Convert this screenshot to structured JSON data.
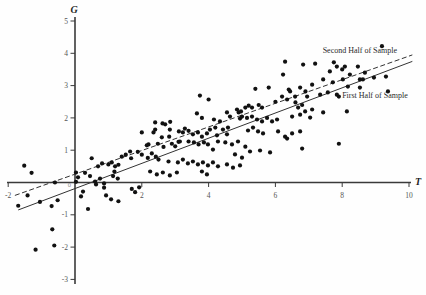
{
  "figure": {
    "background": "#fefefe"
  },
  "chart_data": {
    "type": "scatter",
    "title": "",
    "xlabel": "T",
    "ylabel": "G",
    "x_axis": {
      "min": -2,
      "max": 10,
      "ticks": [
        -2,
        2,
        4,
        6,
        8,
        10
      ]
    },
    "y_axis": {
      "min": -3,
      "max": 5,
      "ticks": [
        5,
        4,
        3,
        2,
        1,
        -1,
        -2,
        -3
      ]
    },
    "origin_label": "0",
    "grid": false,
    "legend_position": "inline-annotations",
    "colors": {
      "point": "#111111",
      "axis": "#3a3a3a",
      "tick_label": "#555555",
      "origin_label": "#8a8a8a",
      "line": "#333333",
      "annotation": "#2a2a2a"
    },
    "lines": [
      {
        "label": "Second Half of Sample",
        "style": "dashed",
        "x1": -1.8,
        "y1": -0.4,
        "x2": 10.1,
        "y2": 3.95
      },
      {
        "label": "First Half of Sample",
        "style": "solid",
        "x1": -1.7,
        "y1": -0.85,
        "x2": 10.1,
        "y2": 3.75
      }
    ],
    "annotations": [
      {
        "text": "Second Half of Sample",
        "x": 8.53,
        "y": 4.1
      },
      {
        "text": "First Half of Sample",
        "x": 8.98,
        "y": 2.71
      }
    ],
    "series": [
      {
        "name": "observations",
        "points": [
          [
            -1.52,
            0.52
          ],
          [
            -1.3,
            0.3
          ],
          [
            -1.7,
            -0.72
          ],
          [
            -1.42,
            -0.4
          ],
          [
            -1.05,
            -0.6
          ],
          [
            -0.7,
            -0.73
          ],
          [
            -0.52,
            -0.55
          ],
          [
            -0.6,
            0.0
          ],
          [
            -0.68,
            -1.45
          ],
          [
            -1.18,
            -2.08
          ],
          [
            -0.62,
            -1.95
          ],
          [
            0.03,
            0.31
          ],
          [
            0.09,
            0.16
          ],
          [
            0.03,
            0.02
          ],
          [
            0.24,
            -0.28
          ],
          [
            0.18,
            -0.43
          ],
          [
            0.39,
            -0.82
          ],
          [
            0.69,
            0.5
          ],
          [
            0.81,
            0.59
          ],
          [
            0.63,
            -0.06
          ],
          [
            0.87,
            -0.16
          ],
          [
            0.93,
            -0.4
          ],
          [
            1.08,
            -0.52
          ],
          [
            0.3,
            0.3
          ],
          [
            0.45,
            0.2
          ],
          [
            0.6,
            0.03
          ],
          [
            0.75,
            0.12
          ],
          [
            0.87,
            -0.03
          ],
          [
            0.5,
            0.75
          ],
          [
            1.0,
            0.56
          ],
          [
            1.1,
            0.62
          ],
          [
            1.2,
            0.5
          ],
          [
            1.3,
            0.55
          ],
          [
            1.14,
            0.2
          ],
          [
            1.28,
            0.12
          ],
          [
            1.18,
            0.34
          ],
          [
            1.4,
            0.8
          ],
          [
            1.52,
            0.86
          ],
          [
            1.68,
            0.75
          ],
          [
            1.88,
            0.95
          ],
          [
            1.65,
            0.96
          ],
          [
            1.3,
            -0.58
          ],
          [
            1.7,
            -0.2
          ],
          [
            1.8,
            -0.3
          ],
          [
            1.92,
            -0.15
          ],
          [
            2.0,
            1.55
          ],
          [
            2.35,
            1.55
          ],
          [
            2.6,
            1.4
          ],
          [
            2.82,
            1.42
          ],
          [
            2.2,
            1.18
          ],
          [
            2.48,
            1.2
          ],
          [
            2.65,
            1.1
          ],
          [
            2.9,
            1.2
          ],
          [
            3.0,
            1.12
          ],
          [
            2.0,
            0.86
          ],
          [
            2.18,
            0.76
          ],
          [
            2.3,
            0.9
          ],
          [
            2.42,
            0.8
          ],
          [
            2.4,
            1.64
          ],
          [
            2.62,
            1.83
          ],
          [
            2.84,
            1.64
          ],
          [
            2.4,
            1.86
          ],
          [
            2.7,
            1.8
          ],
          [
            2.85,
            1.88
          ],
          [
            2.5,
            0.71
          ],
          [
            2.8,
            0.65
          ],
          [
            2.25,
            0.34
          ],
          [
            2.45,
            0.25
          ],
          [
            2.63,
            0.31
          ],
          [
            2.84,
            0.22
          ],
          [
            2.15,
            1.15
          ],
          [
            3.1,
            1.26
          ],
          [
            3.65,
            2.14
          ],
          [
            3.8,
            2.0
          ],
          [
            3.74,
            2.69
          ],
          [
            3.23,
            1.55
          ],
          [
            3.4,
            1.6
          ],
          [
            3.53,
            1.49
          ],
          [
            3.68,
            1.55
          ],
          [
            3.8,
            1.42
          ],
          [
            3.95,
            1.52
          ],
          [
            3.14,
            1.27
          ],
          [
            3.4,
            1.27
          ],
          [
            3.56,
            1.24
          ],
          [
            3.7,
            1.18
          ],
          [
            3.86,
            1.24
          ],
          [
            3.98,
            1.18
          ],
          [
            3.08,
            0.62
          ],
          [
            3.23,
            0.71
          ],
          [
            3.38,
            0.59
          ],
          [
            3.53,
            0.65
          ],
          [
            3.68,
            0.56
          ],
          [
            3.83,
            0.62
          ],
          [
            3.98,
            0.53
          ],
          [
            3.05,
            0.31
          ],
          [
            3.8,
            0.34
          ],
          [
            3.95,
            0.25
          ],
          [
            3.11,
            1.58
          ],
          [
            3.29,
            1.67
          ],
          [
            4.55,
            2.17
          ],
          [
            4.64,
            2.04
          ],
          [
            4.9,
            2.17
          ],
          [
            4.94,
            1.98
          ],
          [
            4.34,
            1.89
          ],
          [
            4.16,
            1.95
          ],
          [
            4.0,
            2.57
          ],
          [
            4.85,
            2.26
          ],
          [
            4.97,
            2.2
          ],
          [
            4.13,
            0.62
          ],
          [
            4.28,
            0.5
          ],
          [
            4.55,
            0.56
          ],
          [
            4.73,
            0.46
          ],
          [
            4.94,
            0.53
          ],
          [
            4.2,
            1.7
          ],
          [
            4.04,
            1.64
          ],
          [
            4.28,
            1.27
          ],
          [
            4.5,
            1.24
          ],
          [
            4.7,
            1.18
          ],
          [
            4.88,
            1.27
          ],
          [
            4.55,
            1.49
          ],
          [
            4.13,
            1.02
          ],
          [
            4.79,
            0.87
          ],
          [
            4.43,
            1.64
          ],
          [
            4.58,
            1.7
          ],
          [
            4.25,
            1.46
          ],
          [
            5.4,
            2.9
          ],
          [
            5.8,
            2.94
          ],
          [
            5.1,
            2.32
          ],
          [
            5.2,
            2.38
          ],
          [
            5.3,
            2.32
          ],
          [
            5.5,
            2.4
          ],
          [
            5.6,
            2.32
          ],
          [
            5.0,
            2.04
          ],
          [
            5.15,
            2.0
          ],
          [
            5.3,
            2.04
          ],
          [
            5.45,
            1.95
          ],
          [
            5.6,
            1.89
          ],
          [
            5.75,
            2.0
          ],
          [
            5.9,
            1.89
          ],
          [
            5.0,
            0.77
          ],
          [
            5.18,
            1.61
          ],
          [
            5.33,
            1.7
          ],
          [
            5.48,
            1.58
          ],
          [
            5.63,
            1.52
          ],
          [
            5.1,
            1.11
          ],
          [
            5.24,
            0.96
          ],
          [
            5.54,
            0.99
          ],
          [
            5.84,
            0.93
          ],
          [
            6.4,
            2.88
          ],
          [
            6.9,
            2.82
          ],
          [
            6.2,
            2.66
          ],
          [
            6.05,
            1.95
          ],
          [
            6.0,
            2.5
          ],
          [
            6.35,
            2.57
          ],
          [
            6.6,
            2.48
          ],
          [
            6.8,
            2.4
          ],
          [
            6.29,
            3.74
          ],
          [
            6.23,
            3.34
          ],
          [
            6.83,
            3.65
          ],
          [
            6.08,
            1.58
          ],
          [
            6.29,
            1.42
          ],
          [
            6.5,
            1.52
          ],
          [
            6.74,
            1.58
          ],
          [
            6.44,
            2.82
          ],
          [
            6.59,
            2.66
          ],
          [
            6.74,
            2.94
          ],
          [
            6.95,
            2.66
          ],
          [
            6.68,
            2.32
          ],
          [
            6.89,
            2.2
          ],
          [
            6.74,
            2.1
          ],
          [
            6.5,
            2.04
          ],
          [
            6.35,
            1.36
          ],
          [
            6.8,
            1.05
          ],
          [
            7.19,
            3.68
          ],
          [
            7.75,
            3.72
          ],
          [
            7.63,
            3.44
          ],
          [
            7.1,
            3.03
          ],
          [
            7.43,
            3.19
          ],
          [
            7.34,
            2.72
          ],
          [
            7.57,
            2.79
          ],
          [
            7.1,
            2.26
          ],
          [
            7.43,
            2.17
          ],
          [
            7.04,
            2.01
          ],
          [
            7.84,
            3.59
          ],
          [
            7.72,
            3.1
          ],
          [
            7.84,
            2.72
          ],
          [
            7.9,
            2.66
          ],
          [
            7.9,
            1.2
          ],
          [
            8.0,
            3.5
          ],
          [
            8.23,
            3.34
          ],
          [
            8.53,
            3.19
          ],
          [
            8.68,
            3.4
          ],
          [
            8.95,
            3.25
          ],
          [
            8.14,
            2.2
          ],
          [
            8.08,
            3.59
          ],
          [
            8.47,
            3.59
          ],
          [
            8.02,
            3.19
          ],
          [
            8.17,
            2.97
          ],
          [
            8.53,
            2.94
          ],
          [
            8.62,
            3.19
          ],
          [
            9.19,
            4.22
          ],
          [
            9.31,
            3.28
          ],
          [
            9.37,
            2.82
          ]
        ]
      }
    ]
  }
}
